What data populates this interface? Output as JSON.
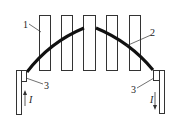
{
  "diagram": {
    "labels": {
      "plates": "1",
      "strip": "2",
      "contact_left": "3",
      "contact_right": "3",
      "current_left": "I",
      "current_right": "I"
    },
    "colors": {
      "stroke": "#333333",
      "strip": "#111111",
      "background": "#ffffff"
    },
    "components": [
      {
        "id": 1,
        "name": "vertical plates",
        "count": 5
      },
      {
        "id": 2,
        "name": "curved conductor strip"
      },
      {
        "id": 3,
        "name": "end contacts",
        "count": 2
      }
    ],
    "current_direction": {
      "left": "up",
      "right": "down"
    }
  }
}
